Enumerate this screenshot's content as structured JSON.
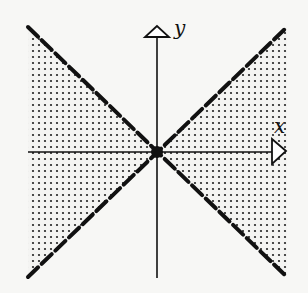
{
  "diagram": {
    "title": "",
    "axes": {
      "x_label": "x",
      "y_label": "y"
    },
    "lines": [
      {
        "name": "y = x",
        "style": "dashed"
      },
      {
        "name": "y = -x",
        "style": "dashed"
      }
    ],
    "shaded_region": "|y| < |x| (left and right wedges, dotted fill)",
    "origin_marker": "filled dot",
    "colors": {
      "ink": "#111111",
      "background": "#f7f7f5",
      "fill_dot": "#222222"
    }
  }
}
